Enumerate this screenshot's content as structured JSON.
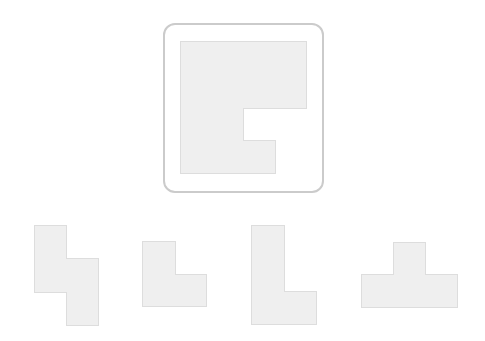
{
  "puzzle": {
    "colors": {
      "piece_fill": "#efefef",
      "piece_edge": "#dddddd",
      "frame_border": "#cbcbcb",
      "background": "#ffffff"
    },
    "target": {
      "name": "target-shape",
      "description": "Square with a rectangular notch cut from the right side",
      "frame": {
        "x": 163,
        "y": 23,
        "w": 161,
        "h": 170
      },
      "points": "180,41 306,41 306,108 243,108 243,140 275,140 275,173 180,173"
    },
    "options": [
      {
        "name": "option-1-s-shape",
        "description": "S/Z-shaped piece",
        "points": "34,225 66,225 66,258 98,258 98,325 66,325 66,292 34,292"
      },
      {
        "name": "option-2-small-l",
        "description": "Small L-shaped piece",
        "points": "142,241 175,241 175,274 206,274 206,306 142,306"
      },
      {
        "name": "option-3-tall-l",
        "description": "Tall L-shaped piece",
        "points": "251,225 284,225 284,291 316,291 316,324 251,324"
      },
      {
        "name": "option-4-t-shape",
        "description": "T-shaped piece",
        "points": "393,242 425,242 425,274 457,274 457,307 361,307 361,274 393,274"
      }
    ]
  }
}
